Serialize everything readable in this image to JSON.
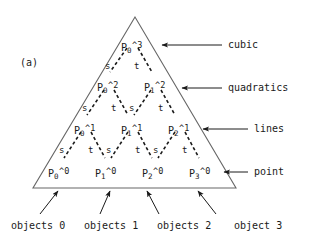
{
  "figure": {
    "panel_label": "(a)",
    "background": "#ffffff",
    "ink": "#1a1a1a",
    "line_color": "#555555"
  },
  "nodes": {
    "row_cubic": [
      {
        "base": "P",
        "sub": "0",
        "sup": "^3",
        "x": 121,
        "y": 41
      }
    ],
    "row_quadratics": [
      {
        "base": "P",
        "sub": "0",
        "sup": "^2",
        "x": 97,
        "y": 81
      },
      {
        "base": "P",
        "sub": "1",
        "sup": "^2",
        "x": 144,
        "y": 81
      }
    ],
    "row_lines": [
      {
        "base": "P",
        "sub": "0",
        "sup": "^1",
        "x": 74,
        "y": 124
      },
      {
        "base": "P",
        "sub": "1",
        "sup": "^1",
        "x": 121,
        "y": 124
      },
      {
        "base": "P",
        "sub": "2",
        "sup": "^1",
        "x": 168,
        "y": 124
      }
    ],
    "row_point": [
      {
        "base": "P",
        "sub": "0",
        "sup": "^0",
        "x": 48,
        "y": 167
      },
      {
        "base": "P",
        "sub": "1",
        "sup": "^0",
        "x": 95,
        "y": 167
      },
      {
        "base": "P",
        "sub": "2",
        "sup": "^0",
        "x": 142,
        "y": 167
      },
      {
        "base": "P",
        "sub": "3",
        "sup": "^0",
        "x": 189,
        "y": 167
      }
    ]
  },
  "edge_labels": [
    {
      "text": "s",
      "x": 105,
      "y": 62
    },
    {
      "text": "t",
      "x": 134,
      "y": 62
    },
    {
      "text": "s",
      "x": 82,
      "y": 104
    },
    {
      "text": "t",
      "x": 111,
      "y": 104
    },
    {
      "text": "s",
      "x": 129,
      "y": 104
    },
    {
      "text": "t",
      "x": 158,
      "y": 104
    },
    {
      "text": "s",
      "x": 59,
      "y": 146
    },
    {
      "text": "t",
      "x": 88,
      "y": 146
    },
    {
      "text": "s",
      "x": 106,
      "y": 146
    },
    {
      "text": "t",
      "x": 135,
      "y": 146
    },
    {
      "text": "s",
      "x": 153,
      "y": 146
    },
    {
      "text": "t",
      "x": 182,
      "y": 146
    }
  ],
  "side_labels": [
    {
      "text": "cubic",
      "x": 228,
      "y": 40,
      "arrow_from_x": 222,
      "arrow_from_y": 45,
      "arrow_to_x": 162,
      "arrow_to_y": 45
    },
    {
      "text": "quadratics",
      "x": 228,
      "y": 83,
      "arrow_from_x": 222,
      "arrow_from_y": 88,
      "arrow_to_x": 182,
      "arrow_to_y": 88
    },
    {
      "text": "lines",
      "x": 254,
      "y": 124,
      "arrow_from_x": 248,
      "arrow_from_y": 129,
      "arrow_to_x": 203,
      "arrow_to_y": 129
    },
    {
      "text": "point",
      "x": 254,
      "y": 167,
      "arrow_from_x": 248,
      "arrow_from_y": 172,
      "arrow_to_x": 224,
      "arrow_to_y": 172
    }
  ],
  "bottom_labels": [
    {
      "text": "objects 0",
      "x": 11,
      "y": 221,
      "arrow_from_x": 40,
      "arrow_from_y": 214,
      "arrow_to_x": 58,
      "arrow_to_y": 191
    },
    {
      "text": "objects 1",
      "x": 84,
      "y": 221,
      "arrow_from_x": 100,
      "arrow_from_y": 214,
      "arrow_to_x": 110,
      "arrow_to_y": 191
    },
    {
      "text": "objects 2",
      "x": 157,
      "y": 221,
      "arrow_from_x": 159,
      "arrow_from_y": 214,
      "arrow_to_x": 147,
      "arrow_to_y": 191
    },
    {
      "text": "object 3",
      "x": 234,
      "y": 221,
      "arrow_from_x": 216,
      "arrow_from_y": 214,
      "arrow_to_x": 198,
      "arrow_to_y": 191
    }
  ],
  "triangle": {
    "apex_x": 135,
    "apex_y": 17,
    "left_x": 33,
    "left_y": 188,
    "right_x": 236,
    "right_y": 188
  },
  "dashed_edges": [
    {
      "x1": 127,
      "y1": 48,
      "x2": 110,
      "y2": 72
    },
    {
      "x1": 138,
      "y1": 48,
      "x2": 152,
      "y2": 72
    },
    {
      "x1": 104,
      "y1": 90,
      "x2": 87,
      "y2": 115
    },
    {
      "x1": 114,
      "y1": 90,
      "x2": 128,
      "y2": 115
    },
    {
      "x1": 151,
      "y1": 90,
      "x2": 134,
      "y2": 115
    },
    {
      "x1": 161,
      "y1": 90,
      "x2": 175,
      "y2": 115
    },
    {
      "x1": 81,
      "y1": 132,
      "x2": 64,
      "y2": 158
    },
    {
      "x1": 91,
      "y1": 132,
      "x2": 105,
      "y2": 158
    },
    {
      "x1": 128,
      "y1": 132,
      "x2": 111,
      "y2": 158
    },
    {
      "x1": 138,
      "y1": 132,
      "x2": 152,
      "y2": 158
    },
    {
      "x1": 175,
      "y1": 132,
      "x2": 158,
      "y2": 158
    },
    {
      "x1": 185,
      "y1": 132,
      "x2": 199,
      "y2": 158
    }
  ]
}
